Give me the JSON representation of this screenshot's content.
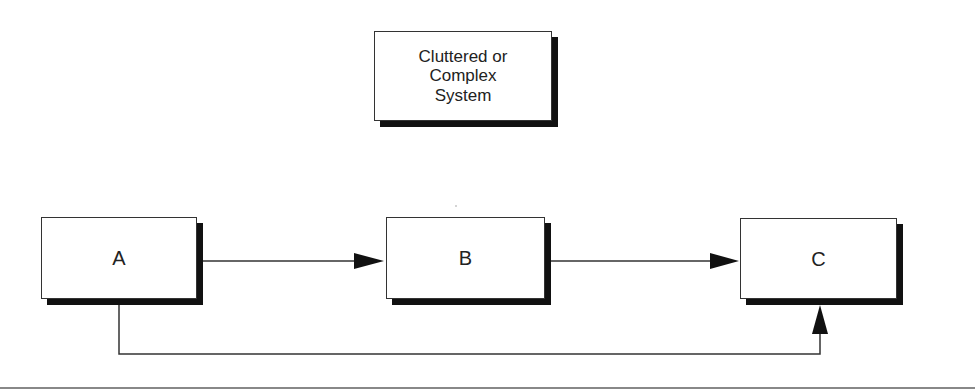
{
  "diagram": {
    "top_box": {
      "label": "Cluttered or\nComplex\nSystem"
    },
    "nodes": [
      {
        "id": "A",
        "label": "A"
      },
      {
        "id": "B",
        "label": "B"
      },
      {
        "id": "C",
        "label": "C"
      }
    ],
    "edges": [
      {
        "from": "A",
        "to": "B"
      },
      {
        "from": "B",
        "to": "C"
      },
      {
        "from": "A",
        "to": "C",
        "route": "below"
      }
    ],
    "colors": {
      "line": "#333333",
      "shadow": "#111111",
      "background": "#ffffff"
    }
  }
}
